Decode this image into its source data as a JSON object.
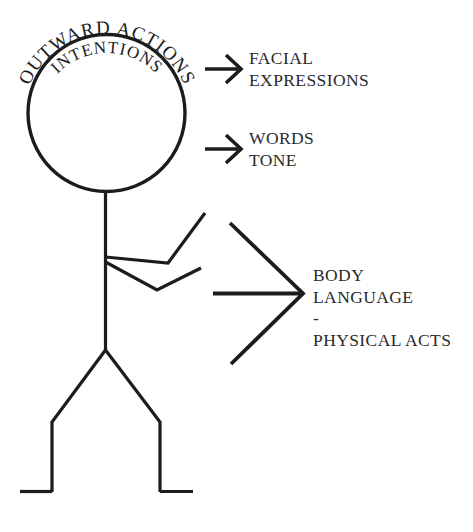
{
  "diagram": {
    "background_color": "#ffffff",
    "ink_color": "#1c1c1c",
    "head": {
      "outer_arc_text": "OUTWARD ACTIONS",
      "inner_arc_text": "INTENTIONS"
    },
    "arrows": [
      {
        "id": "arrow-facial",
        "type": "small-arrow",
        "label_lines": [
          "FACIAL",
          "EXPRESSIONS"
        ],
        "label_text": "FACIAL\nEXPRESSIONS"
      },
      {
        "id": "arrow-words",
        "type": "small-arrow",
        "label_lines": [
          "WORDS",
          "TONE"
        ],
        "label_text": "WORDS\nTONE"
      },
      {
        "id": "arrow-body",
        "type": "large-arrow",
        "label_lines": [
          "BODY",
          "LANGUAGE",
          "-",
          "PHYSICAL ACTS"
        ],
        "label_text": "BODY\nLANGUAGE\n-\nPHYSICAL ACTS"
      }
    ],
    "figure": {
      "parts": [
        "head",
        "torso",
        "upper-arm",
        "lower-arm",
        "left-leg",
        "right-leg",
        "left-foot",
        "right-foot"
      ]
    }
  }
}
